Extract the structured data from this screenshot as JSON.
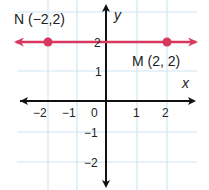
{
  "graph": {
    "axis_labels": {
      "x": "x",
      "y": "y"
    },
    "x_ticks": [
      "−2",
      "−1",
      "0",
      "1",
      "2"
    ],
    "y_ticks": [
      "2",
      "1",
      "−1",
      "−2"
    ],
    "points": [
      {
        "name": "N",
        "label": "N (−2,2)",
        "x": -2,
        "y": 2
      },
      {
        "name": "M",
        "label": "M (2, 2)",
        "x": 2,
        "y": 2
      }
    ],
    "line": {
      "equation": "y = 2",
      "color": "#d8385e"
    },
    "grid_color": "#cfe6f2",
    "axis_color": "#111111"
  }
}
